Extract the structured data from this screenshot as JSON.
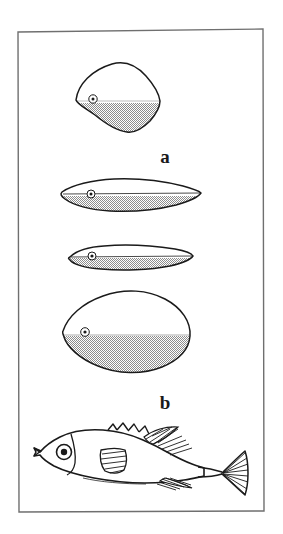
{
  "figure": {
    "caption_labels": {
      "panel_a": "a",
      "panel_b": "b"
    },
    "frame": {
      "stroke_color": "#6f6f6f",
      "fill_color": "#ffffff",
      "x": 17,
      "y": 29,
      "width": 247,
      "height": 483
    },
    "background_color": "#ffffff",
    "ink_color": "#1a1a1a",
    "shade_color": "#a8a8a8"
  },
  "panel_a": {
    "label": "a",
    "label_x": 165,
    "label_y": 163,
    "description": "Four fish body outlines in lateral view, each with an eye and a stippled ventral (lower) region",
    "shapes": [
      {
        "name": "deep-bodied-diamond",
        "outline_label": "rhomboid deep body",
        "eye_cx": 93,
        "eye_cy": 99,
        "eye_r_outer": 4.2,
        "eye_r_inner": 1.5,
        "waterline_y": 103
      },
      {
        "name": "lenticular-fusiform",
        "outline_label": "lens shaped body",
        "eye_cx": 91,
        "eye_cy": 194,
        "eye_r_outer": 4.0,
        "eye_r_inner": 1.5,
        "waterline_y": 196
      },
      {
        "name": "slender-elongate",
        "outline_label": "elongate slender body",
        "eye_cx": 92,
        "eye_cy": 256,
        "eye_r_outer": 4.0,
        "eye_r_inner": 1.6,
        "waterline_y": 258
      },
      {
        "name": "ovate-deep",
        "outline_label": "ovate deep body",
        "eye_cx": 85,
        "eye_cy": 332,
        "eye_r_outer": 4.3,
        "eye_r_inner": 1.6,
        "waterline_y": 336
      }
    ]
  },
  "panel_b": {
    "label": "b",
    "label_x": 165,
    "label_y": 409,
    "description": "Complete lateral view drawing of a fish with spiny dorsal fin, soft dorsal fin, pectoral fin, anal fin and forked caudal fin",
    "fish": {
      "eye_cx": 64,
      "eye_cy": 452,
      "eye_r_outer": 7.5,
      "eye_r_inner": 3.2,
      "parts": [
        "snout",
        "eye",
        "operculum",
        "pectoral-fin",
        "spiny-dorsal-fin",
        "soft-dorsal-fin",
        "anal-fin",
        "caudal-peduncle",
        "caudal-fin"
      ]
    }
  }
}
